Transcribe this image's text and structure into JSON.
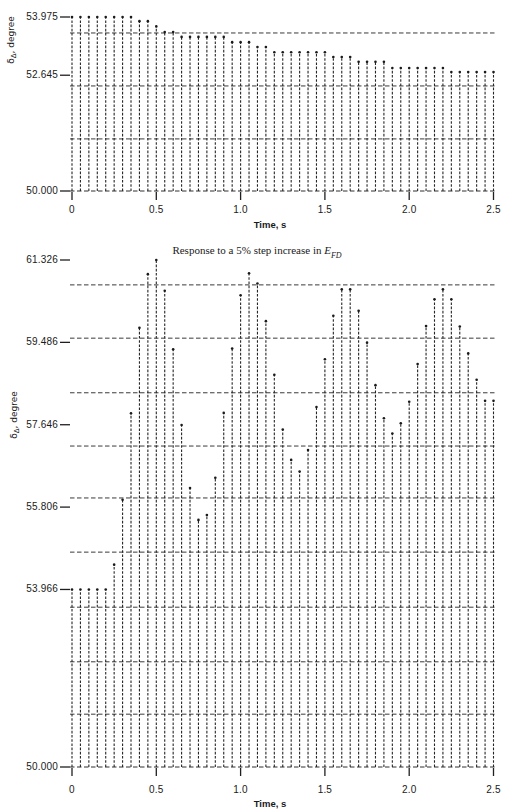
{
  "chart_data": [
    {
      "type": "bar",
      "title": "",
      "xlabel": "Time, s",
      "ylabel": "δΔ, degree",
      "ylabel_parts": {
        "symbol": "δ",
        "subscript": "Δ",
        "suffix": ", degree"
      },
      "xlim": [
        0,
        2.5
      ],
      "ylim": [
        50.0,
        53.975
      ],
      "x_ticks": [
        "0",
        "0.5",
        "1.0",
        "1.5",
        "2.0",
        "2.5"
      ],
      "x_tick_values": [
        0,
        0.5,
        1.0,
        1.5,
        2.0,
        2.5
      ],
      "y_ticks": [
        "53.975",
        "52.645",
        "50.000"
      ],
      "y_tick_values": [
        53.975,
        52.645,
        50.0
      ],
      "grid": true,
      "gridlines_y": [
        51.19,
        52.4,
        53.61
      ],
      "legend": null,
      "x": [
        0,
        0.05,
        0.1,
        0.15,
        0.2,
        0.25,
        0.3,
        0.35,
        0.4,
        0.45,
        0.5,
        0.55,
        0.6,
        0.65,
        0.7,
        0.75,
        0.8,
        0.85,
        0.9,
        0.95,
        1.0,
        1.05,
        1.1,
        1.15,
        1.2,
        1.25,
        1.3,
        1.35,
        1.4,
        1.45,
        1.5,
        1.55,
        1.6,
        1.65,
        1.7,
        1.75,
        1.8,
        1.85,
        1.9,
        1.95,
        2.0,
        2.05,
        2.1,
        2.15,
        2.2,
        2.25,
        2.3,
        2.35,
        2.4,
        2.45,
        2.5
      ],
      "series": [
        {
          "name": "δΔ",
          "values": [
            53.975,
            53.975,
            53.975,
            53.975,
            53.975,
            53.975,
            53.975,
            53.975,
            53.88,
            53.88,
            53.76,
            53.63,
            53.63,
            53.52,
            53.52,
            53.52,
            53.52,
            53.52,
            53.52,
            53.4,
            53.4,
            53.4,
            53.29,
            53.29,
            53.17,
            53.17,
            53.17,
            53.17,
            53.17,
            53.17,
            53.17,
            53.06,
            53.06,
            53.06,
            52.95,
            52.95,
            52.95,
            52.95,
            52.81,
            52.81,
            52.81,
            52.81,
            52.81,
            52.81,
            52.81,
            52.72,
            52.72,
            52.72,
            52.72,
            52.72,
            52.72
          ]
        }
      ]
    },
    {
      "type": "bar",
      "title": "Response to a 5% step increase in E_FD",
      "title_parts": {
        "prefix": "Response to a 5% step increase in ",
        "variable": "E",
        "subscript": "FD"
      },
      "xlabel": "Time, s",
      "ylabel": "δΔ, degree",
      "ylabel_parts": {
        "symbol": "δ",
        "subscript": "Δ",
        "suffix": ", degree"
      },
      "xlim": [
        0,
        2.5
      ],
      "ylim": [
        50.0,
        61.326
      ],
      "x_ticks": [
        "0",
        "0.5",
        "1.0",
        "1.5",
        "2.0",
        "2.5"
      ],
      "x_tick_values": [
        0,
        0.5,
        1.0,
        1.5,
        2.0,
        2.5
      ],
      "y_ticks": [
        "61.326",
        "59.486",
        "57.646",
        "55.806",
        "53.966",
        "50.000"
      ],
      "y_tick_values": [
        61.326,
        59.486,
        57.646,
        55.806,
        53.966,
        50.0
      ],
      "grid": true,
      "gridlines_y": [
        51.18,
        52.35,
        53.57,
        54.8,
        56.01,
        57.17,
        58.36,
        59.58,
        60.77
      ],
      "legend": null,
      "x": [
        0,
        0.05,
        0.1,
        0.15,
        0.2,
        0.25,
        0.3,
        0.35,
        0.4,
        0.45,
        0.5,
        0.55,
        0.6,
        0.65,
        0.7,
        0.75,
        0.8,
        0.85,
        0.9,
        0.95,
        1.0,
        1.05,
        1.1,
        1.15,
        1.2,
        1.25,
        1.3,
        1.35,
        1.4,
        1.45,
        1.5,
        1.55,
        1.6,
        1.65,
        1.7,
        1.75,
        1.8,
        1.85,
        1.9,
        1.95,
        2.0,
        2.05,
        2.1,
        2.15,
        2.2,
        2.25,
        2.3,
        2.35,
        2.4,
        2.45,
        2.5
      ],
      "series": [
        {
          "name": "δΔ",
          "values": [
            53.966,
            53.966,
            53.966,
            53.966,
            53.966,
            54.52,
            55.97,
            57.9,
            59.81,
            61.01,
            61.326,
            60.64,
            59.33,
            57.64,
            56.23,
            55.52,
            55.63,
            56.46,
            57.91,
            59.35,
            60.54,
            61.03,
            60.8,
            59.96,
            58.76,
            57.54,
            56.86,
            56.6,
            57.08,
            58.04,
            59.11,
            60.08,
            60.67,
            60.67,
            60.19,
            59.48,
            58.53,
            57.79,
            57.45,
            57.68,
            58.16,
            59.0,
            59.85,
            60.45,
            60.67,
            60.45,
            59.84,
            59.24,
            58.65,
            58.18,
            58.18
          ]
        }
      ]
    }
  ]
}
